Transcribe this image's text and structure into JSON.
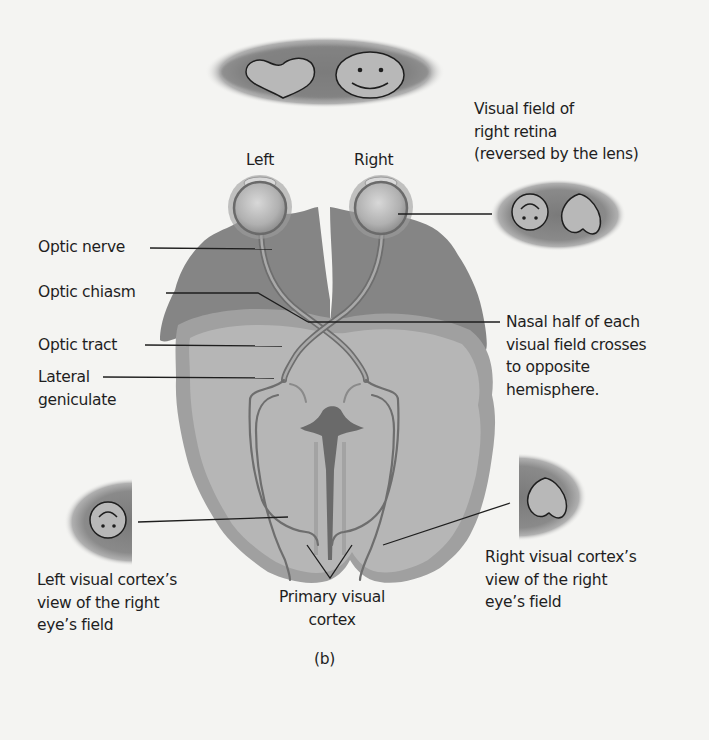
{
  "figure": {
    "panel_label": "(b)",
    "colors": {
      "background": "#f4f4f2",
      "outer_brain": "#8a8a8a",
      "inner_brain": "#b4b4b4",
      "rim": "#9a9a9a",
      "nerve": "#6e6e6e",
      "field_oval": "#7c7c7c",
      "object_fill": "#b8b8b8",
      "leader_line": "#1e1e1e"
    },
    "visual_field_top": {
      "objects": [
        "heart-icon",
        "smiley-face-icon"
      ]
    },
    "eye_labels": {
      "left": "Left",
      "right": "Right"
    },
    "right_retina_field": {
      "label_lines": [
        "Visual field of",
        "right retina",
        "(reversed by the lens)"
      ],
      "objects": [
        "upside-down-smiley-icon",
        "upside-down-heart-icon"
      ]
    },
    "left_labels": {
      "optic_nerve": "Optic nerve",
      "optic_chiasm": "Optic chiasm",
      "optic_tract": "Optic tract",
      "lateral_geniculate": [
        "Lateral",
        "geniculate"
      ]
    },
    "nasal_note": [
      "Nasal half of each",
      "visual field crosses",
      "to opposite",
      "hemisphere."
    ],
    "left_cortex_view": {
      "label_lines": [
        "Left visual cortex’s",
        "view of the right",
        "eye’s field"
      ],
      "objects": [
        "upside-down-smiley-icon"
      ]
    },
    "right_cortex_view": {
      "label_lines": [
        "Right visual cortex’s",
        "view of the right",
        "eye’s field"
      ],
      "objects": [
        "upside-down-heart-icon"
      ]
    },
    "primary_visual_cortex": [
      "Primary visual",
      "cortex"
    ]
  }
}
